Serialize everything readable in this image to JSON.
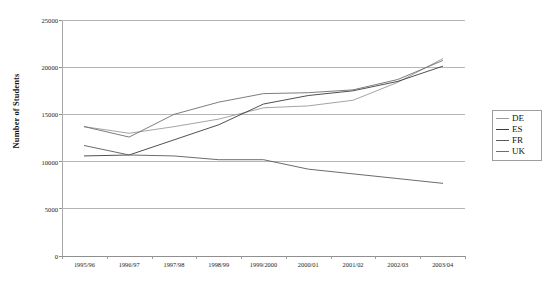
{
  "chart_data": {
    "type": "line",
    "title": "",
    "xlabel": "",
    "ylabel": "Number of Students",
    "ylim": [
      0,
      25000
    ],
    "yticks": [
      0,
      5000,
      10000,
      15000,
      20000,
      25000
    ],
    "ytick_labels": [
      "0",
      "5000",
      "10000",
      "15000",
      "20000",
      "25000"
    ],
    "grid": true,
    "legend_position": "right",
    "categories": [
      "1995/96",
      "1996/97",
      "1997/98",
      "1998/99",
      "1999/2000",
      "2000/01",
      "2001/02",
      "2002/03",
      "2003/04"
    ],
    "series": [
      {
        "name": "DE",
        "color": "#9a9a9a",
        "values": [
          13700,
          13000,
          13700,
          14500,
          15700,
          15900,
          16500,
          18400,
          20900
        ]
      },
      {
        "name": "ES",
        "color": "#3c3c3c",
        "values": [
          10600,
          10700,
          12300,
          13900,
          16100,
          17000,
          17500,
          18500,
          20100
        ]
      },
      {
        "name": "FR",
        "color": "#5a5a5a",
        "values": [
          11700,
          10700,
          10600,
          10200,
          10200,
          9200,
          8700,
          8200,
          7700
        ]
      },
      {
        "name": "UK",
        "color": "#6e6e6e",
        "values": [
          13700,
          12600,
          15000,
          16300,
          17200,
          17300,
          17600,
          18700,
          20700
        ]
      }
    ]
  },
  "legend": {
    "items": [
      {
        "label": "DE",
        "color": "#9a9a9a"
      },
      {
        "label": "ES",
        "color": "#3c3c3c"
      },
      {
        "label": "FR",
        "color": "#5a5a5a"
      },
      {
        "label": "UK",
        "color": "#6e6e6e"
      }
    ]
  },
  "axes": {
    "y_title": "Number of Students"
  }
}
